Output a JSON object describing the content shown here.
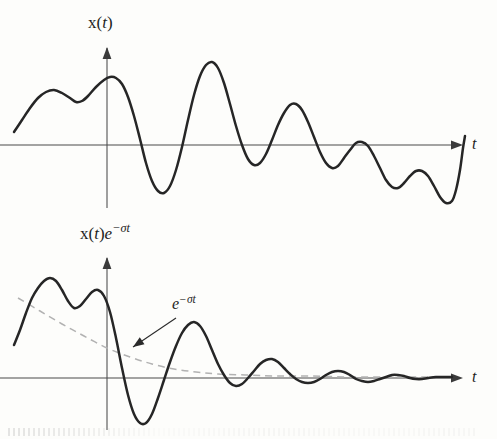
{
  "figure": {
    "background_color": "#fdfdfb",
    "curve_color": "#262626",
    "axis_color": "#4a4a4a",
    "envelope_color": "#b2b2b2"
  },
  "panels": [
    {
      "id": "top",
      "y_axis_label_prefix": "x(",
      "y_axis_label_var": "t",
      "y_axis_label_suffix": ")",
      "y_axis_label_plain": "x(t)",
      "x_axis_label": "t",
      "has_envelope": false
    },
    {
      "id": "bottom",
      "y_axis_label_prefix": "x(",
      "y_axis_label_var": "t",
      "y_axis_label_suffix": ")",
      "y_axis_label_exp_base": "e",
      "y_axis_label_exp_sup": "−σt",
      "y_axis_label_plain": "x(t)e−σt",
      "x_axis_label": "t",
      "has_envelope": true,
      "annotation": {
        "base": "e",
        "superscript": "−σt",
        "plain": "e−σt"
      }
    }
  ],
  "chart_data": [
    {
      "type": "line",
      "title": "x(t)",
      "xlabel": "t",
      "ylabel": "x(t)",
      "grid": false,
      "legend": null,
      "axis": {
        "origin_x": 107,
        "zero_y": 145,
        "x_start": 0,
        "x_end": 456
      },
      "description": "Undamped oscillating signal x(t) with slowly decaying amplitude; crosses zero just right of the vertical axis.",
      "notes": "Traced from pixel coordinates of the printed curve.",
      "points": [
        [
          14,
          132
        ],
        [
          22,
          120
        ],
        [
          30,
          108
        ],
        [
          38,
          98
        ],
        [
          46,
          92
        ],
        [
          54,
          90
        ],
        [
          62,
          93
        ],
        [
          70,
          98
        ],
        [
          76,
          102
        ],
        [
          82,
          101
        ],
        [
          88,
          96
        ],
        [
          96,
          87
        ],
        [
          104,
          80
        ],
        [
          110,
          77
        ],
        [
          116,
          78
        ],
        [
          122,
          84
        ],
        [
          128,
          97
        ],
        [
          134,
          116
        ],
        [
          140,
          139
        ],
        [
          146,
          163
        ],
        [
          152,
          181
        ],
        [
          158,
          191
        ],
        [
          164,
          193
        ],
        [
          170,
          186
        ],
        [
          176,
          170
        ],
        [
          182,
          147
        ],
        [
          188,
          120
        ],
        [
          194,
          95
        ],
        [
          200,
          76
        ],
        [
          206,
          65
        ],
        [
          212,
          62
        ],
        [
          218,
          68
        ],
        [
          224,
          83
        ],
        [
          230,
          104
        ],
        [
          236,
          126
        ],
        [
          242,
          145
        ],
        [
          248,
          159
        ],
        [
          254,
          165
        ],
        [
          260,
          163
        ],
        [
          266,
          154
        ],
        [
          272,
          140
        ],
        [
          278,
          125
        ],
        [
          284,
          113
        ],
        [
          290,
          105
        ],
        [
          296,
          104
        ],
        [
          302,
          110
        ],
        [
          308,
          122
        ],
        [
          314,
          137
        ],
        [
          320,
          152
        ],
        [
          326,
          163
        ],
        [
          332,
          168
        ],
        [
          338,
          166
        ],
        [
          344,
          158
        ],
        [
          350,
          150
        ],
        [
          356,
          143
        ],
        [
          362,
          142
        ],
        [
          368,
          146
        ],
        [
          374,
          156
        ],
        [
          380,
          168
        ],
        [
          386,
          180
        ],
        [
          392,
          187
        ],
        [
          398,
          188
        ],
        [
          404,
          183
        ],
        [
          410,
          176
        ],
        [
          416,
          171
        ],
        [
          422,
          171
        ],
        [
          428,
          176
        ],
        [
          434,
          186
        ],
        [
          440,
          197
        ],
        [
          446,
          203
        ],
        [
          452,
          201
        ],
        [
          456,
          190
        ],
        [
          460,
          170
        ],
        [
          463,
          148
        ],
        [
          465,
          136
        ]
      ]
    },
    {
      "type": "line",
      "title": "x(t)e−σt",
      "xlabel": "t",
      "ylabel": "x(t)e−σt",
      "grid": false,
      "legend": null,
      "axis": {
        "origin_x": 107,
        "zero_y": 378,
        "x_start": 0,
        "x_end": 456
      },
      "description": "Same signal multiplied by a decaying exponential e^(-sigma t); amplitude shrinks rapidly to near zero.",
      "annotation_label": "e−σt",
      "points": [
        [
          14,
          345
        ],
        [
          20,
          330
        ],
        [
          26,
          313
        ],
        [
          32,
          298
        ],
        [
          38,
          288
        ],
        [
          44,
          281
        ],
        [
          50,
          278
        ],
        [
          56,
          281
        ],
        [
          62,
          290
        ],
        [
          68,
          301
        ],
        [
          74,
          308
        ],
        [
          80,
          306
        ],
        [
          86,
          299
        ],
        [
          92,
          292
        ],
        [
          98,
          290
        ],
        [
          104,
          296
        ],
        [
          110,
          312
        ],
        [
          116,
          338
        ],
        [
          122,
          368
        ],
        [
          128,
          395
        ],
        [
          134,
          414
        ],
        [
          140,
          423
        ],
        [
          146,
          423
        ],
        [
          152,
          414
        ],
        [
          158,
          398
        ],
        [
          164,
          380
        ],
        [
          170,
          362
        ],
        [
          176,
          346
        ],
        [
          182,
          333
        ],
        [
          188,
          325
        ],
        [
          194,
          322
        ],
        [
          200,
          326
        ],
        [
          206,
          336
        ],
        [
          212,
          350
        ],
        [
          218,
          364
        ],
        [
          224,
          375
        ],
        [
          230,
          383
        ],
        [
          236,
          386
        ],
        [
          242,
          384
        ],
        [
          248,
          378
        ],
        [
          254,
          371
        ],
        [
          260,
          364
        ],
        [
          266,
          360
        ],
        [
          272,
          359
        ],
        [
          278,
          362
        ],
        [
          284,
          368
        ],
        [
          290,
          374
        ],
        [
          296,
          379
        ],
        [
          302,
          382
        ],
        [
          308,
          383
        ],
        [
          314,
          382
        ],
        [
          320,
          379
        ],
        [
          326,
          375
        ],
        [
          332,
          372
        ],
        [
          338,
          371
        ],
        [
          344,
          372
        ],
        [
          350,
          375
        ],
        [
          356,
          379
        ],
        [
          362,
          381
        ],
        [
          368,
          382
        ],
        [
          374,
          381
        ],
        [
          380,
          379
        ],
        [
          386,
          377
        ],
        [
          392,
          375
        ],
        [
          398,
          375
        ],
        [
          404,
          376
        ],
        [
          410,
          378
        ],
        [
          416,
          379
        ],
        [
          422,
          379
        ],
        [
          428,
          378
        ],
        [
          436,
          377
        ],
        [
          444,
          377
        ],
        [
          452,
          377
        ]
      ],
      "envelope": {
        "label": "e−σt",
        "style": "dashed",
        "color": "#b2b2b2",
        "points": [
          [
            18,
            298
          ],
          [
            40,
            311
          ],
          [
            62,
            324
          ],
          [
            84,
            336
          ],
          [
            107,
            348
          ],
          [
            130,
            357
          ],
          [
            152,
            364
          ],
          [
            174,
            369
          ],
          [
            196,
            372
          ],
          [
            218,
            374
          ],
          [
            245,
            375
          ],
          [
            275,
            376
          ],
          [
            310,
            376
          ],
          [
            350,
            377
          ],
          [
            400,
            377
          ],
          [
            450,
            377
          ]
        ]
      }
    }
  ],
  "annotation_pointer": {
    "from": [
      176,
      318
    ],
    "to": [
      133,
      347
    ],
    "name": "envelope-pointer-arrow"
  }
}
